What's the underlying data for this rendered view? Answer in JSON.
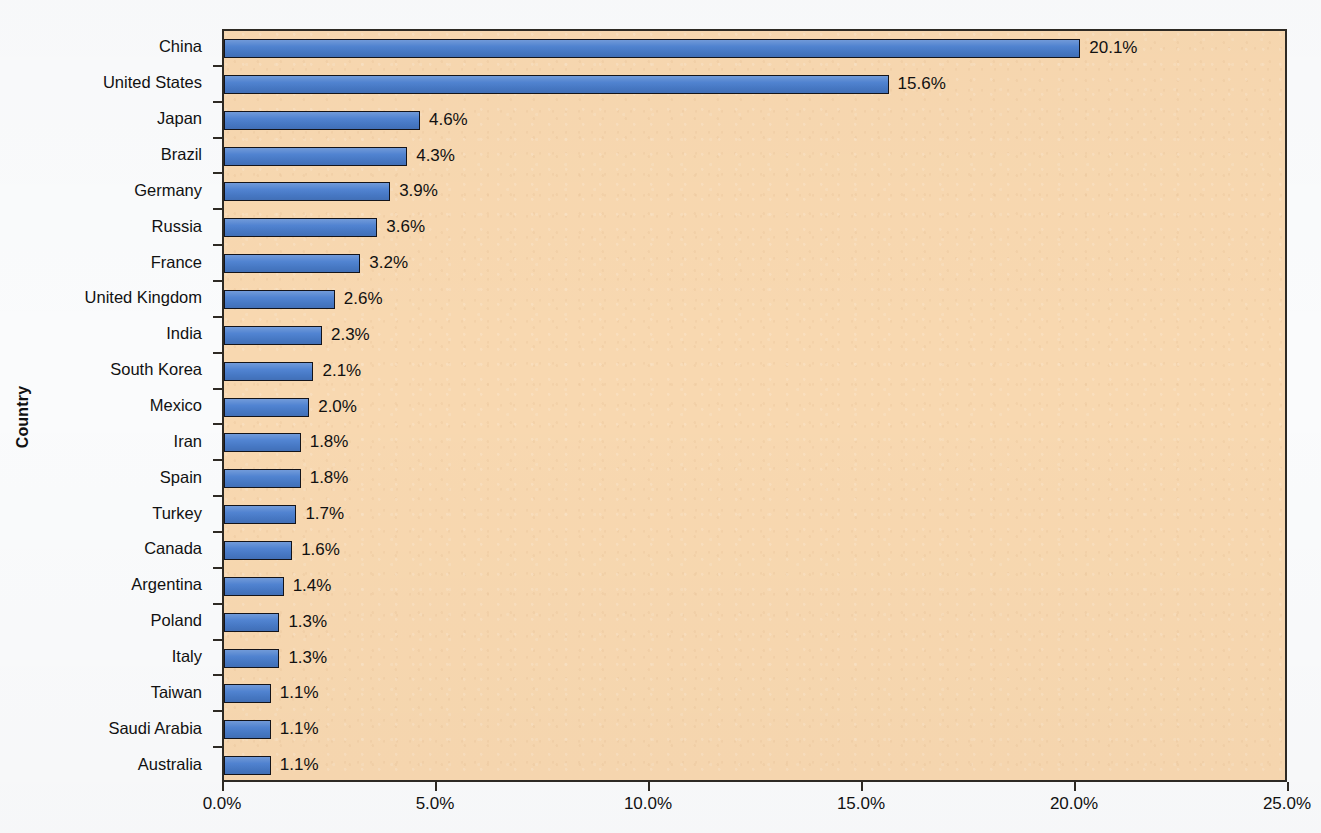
{
  "chart_data": {
    "type": "bar",
    "orientation": "horizontal",
    "title": "",
    "xlabel": "",
    "ylabel": "Country",
    "xlim": [
      0,
      25
    ],
    "xtick_labels": [
      "0.0%",
      "5.0%",
      "10.0%",
      "15.0%",
      "20.0%",
      "25.0%"
    ],
    "xtick_values": [
      0,
      5,
      10,
      15,
      20,
      25
    ],
    "grid": false,
    "legend": null,
    "bar_color": "#4a7fd0",
    "bar_edge_color": "#14141a",
    "plot_background": "#f8d8b0",
    "page_background": "#fafbfc",
    "categories": [
      "China",
      "United States",
      "Japan",
      "Brazil",
      "Germany",
      "Russia",
      "France",
      "United Kingdom",
      "India",
      "South Korea",
      "Mexico",
      "Iran",
      "Spain",
      "Turkey",
      "Canada",
      "Argentina",
      "Poland",
      "Italy",
      "Taiwan",
      "Saudi Arabia",
      "Australia"
    ],
    "values": [
      20.1,
      15.6,
      4.6,
      4.3,
      3.9,
      3.6,
      3.2,
      2.6,
      2.3,
      2.1,
      2.0,
      1.8,
      1.8,
      1.7,
      1.6,
      1.4,
      1.3,
      1.3,
      1.1,
      1.1,
      1.1
    ],
    "value_labels": [
      "20.1%",
      "15.6%",
      "4.6%",
      "4.3%",
      "3.9%",
      "3.6%",
      "3.2%",
      "2.6%",
      "2.3%",
      "2.1%",
      "2.0%",
      "1.8%",
      "1.8%",
      "1.7%",
      "1.6%",
      "1.4%",
      "1.3%",
      "1.3%",
      "1.1%",
      "1.1%",
      "1.1%"
    ]
  }
}
